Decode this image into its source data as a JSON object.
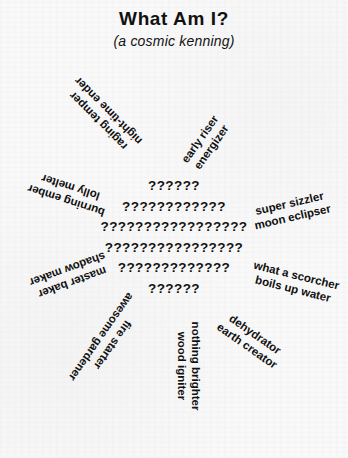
{
  "header": {
    "title": "What Am I?",
    "subtitle": "(a cosmic kenning)"
  },
  "sun": {
    "glyph": "?",
    "rows": [
      "??????",
      "????????????",
      "?????????????????",
      "????????????????",
      "?????????????",
      "??????"
    ]
  },
  "kennings": [
    {
      "id": "raging-temper",
      "line1": "raging temper",
      "line2": "night-time ender"
    },
    {
      "id": "burning-ember",
      "line1": "burning ember",
      "line2": "lolly melter"
    },
    {
      "id": "master-baker",
      "line1": "master baker",
      "line2": "shadow maker"
    },
    {
      "id": "fire-starter",
      "line1": "fire starter",
      "line2": "awesome gardener"
    },
    {
      "id": "nothing-brighter",
      "line1": "nothing brighter",
      "line2": "wood igniter"
    },
    {
      "id": "dehydrator",
      "line1": "dehydrator",
      "line2": "earth creator"
    },
    {
      "id": "what-a-scorcher",
      "line1": "what a scorcher",
      "line2": "boils up water"
    },
    {
      "id": "super-sizzler",
      "line1": "super sizzler",
      "line2": "moon eclipser"
    },
    {
      "id": "early-riser",
      "line1": "early riser",
      "line2": "energizer"
    }
  ],
  "colors": {
    "ink": "#111111",
    "paper": "#f9f9f9"
  }
}
